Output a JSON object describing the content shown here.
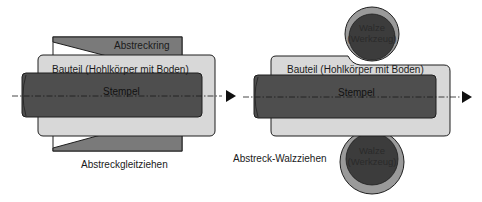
{
  "colors": {
    "ring": "#7a7a7a",
    "bauteil": "#d8d8d8",
    "stempel": "#4e4e4e",
    "roller_outer": "#9a9a9a",
    "roller_inner": "#3c3c3c",
    "outline": "#1e1e1e"
  },
  "left": {
    "ring_label": "Abstreckring",
    "bauteil_label": "Bauteil (Hohlkörper mit Boden)",
    "stempel_label": "Stempel",
    "caption": "Abstreckgleitziehen",
    "arrow_icon": "arrow-right-icon"
  },
  "right": {
    "bauteil_label": "Bauteil (Hohlkörper mit Boden)",
    "stempel_label": "Stempel",
    "caption": "Abstreck-Walzziehen",
    "top_roller": {
      "line1": "Walze",
      "line2": "(Werkzeug)"
    },
    "bottom_roller": {
      "line1": "Walze",
      "line2": "(Werkzeug)"
    },
    "arrow_icon": "arrow-right-icon"
  }
}
